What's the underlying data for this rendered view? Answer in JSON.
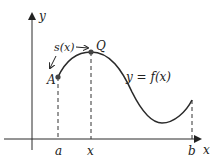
{
  "diagram": {
    "type": "arc-length-of-curve",
    "axes": {
      "x_label": "x",
      "y_label": "y"
    },
    "curve_label": "y = f(x)",
    "points": {
      "A": {
        "label": "A"
      },
      "Q": {
        "label": "Q"
      }
    },
    "arc_label": "s(x)",
    "x_ticks": [
      {
        "id": "a",
        "label": "a"
      },
      {
        "id": "x",
        "label": "x"
      },
      {
        "id": "b",
        "label": "b"
      }
    ],
    "colors": {
      "curve": "#2a2a2a",
      "axes": "#2a2a2a",
      "points": "#444444",
      "background": "#ffffff"
    }
  }
}
